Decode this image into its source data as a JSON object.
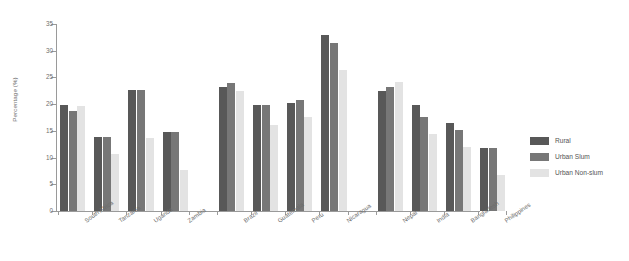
{
  "chart_data": {
    "type": "bar",
    "title": "",
    "xlabel": "",
    "ylabel": "Percentage (%)",
    "ylim": [
      0,
      35
    ],
    "yticks": [
      0,
      5,
      10,
      15,
      20,
      25,
      30,
      35
    ],
    "ytick_labels": [
      "0",
      "5",
      "10",
      "15",
      "20",
      "25",
      "30",
      "35"
    ],
    "grid": false,
    "legend_position": "right",
    "categories": [
      "South Africa",
      "Tanzania",
      "Uganda",
      "Zambia",
      "Brazil",
      "Guatemala",
      "Peru",
      "Nicaragua",
      "Nepal",
      "India",
      "Bangladesh",
      "Philippines"
    ],
    "group_breaks_after": [
      "Zambia",
      "Nicaragua"
    ],
    "series": [
      {
        "name": "Rural",
        "color": "#585858",
        "values": [
          19.8,
          13.8,
          22.7,
          14.8,
          23.2,
          19.8,
          20.3,
          32.9,
          22.5,
          19.8,
          16.5,
          11.8
        ]
      },
      {
        "name": "Urban Slum",
        "color": "#777777",
        "values": [
          18.7,
          13.8,
          22.7,
          14.8,
          23.9,
          19.9,
          20.8,
          31.5,
          23.2,
          17.6,
          15.2,
          11.8
        ]
      },
      {
        "name": "Urban Non-slum",
        "color": "#e3e3e3",
        "values": [
          19.7,
          10.7,
          13.6,
          7.7,
          22.5,
          16.1,
          17.6,
          26.3,
          24.2,
          14.5,
          12.0,
          6.8
        ]
      }
    ]
  },
  "legend": {
    "items": [
      {
        "label": "Rural",
        "color": "#585858"
      },
      {
        "label": "Urban Slum",
        "color": "#777777"
      },
      {
        "label": "Urban Non-slum",
        "color": "#e3e3e3"
      }
    ]
  }
}
